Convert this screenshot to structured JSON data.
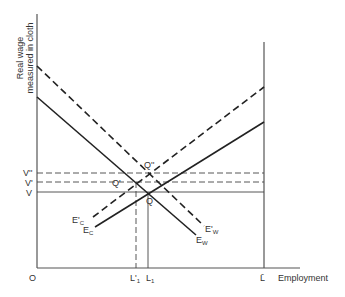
{
  "diagram": {
    "y_axis_label_line1": "Real wage",
    "y_axis_label_line2": "measured in cloth",
    "x_axis_label": "Employment",
    "origin_label": "O",
    "y_ticks": [
      {
        "label": "V''",
        "y": 173
      },
      {
        "label": "V'",
        "y": 182
      },
      {
        "label": "V",
        "y": 192
      }
    ],
    "x_ticks": [
      {
        "label": "L'",
        "sub": "1",
        "x": 136
      },
      {
        "label": "L",
        "sub": "1",
        "x": 148
      },
      {
        "label": "L̄",
        "sub": "",
        "x": 264
      }
    ],
    "points": [
      {
        "label": "Q''",
        "x": 146,
        "y": 172
      },
      {
        "label": "Q'",
        "x": 135,
        "y": 182
      },
      {
        "label": "Q",
        "x": 148,
        "y": 192
      }
    ],
    "curves": [
      {
        "name": "E_W",
        "label": "E",
        "sub": "W",
        "style": "solid",
        "x1": 37,
        "y1": 97,
        "x2": 196,
        "y2": 235
      },
      {
        "name": "E'_W",
        "label": "E'",
        "sub": "W",
        "style": "dashed",
        "x1": 37,
        "y1": 66,
        "x2": 204,
        "y2": 226
      },
      {
        "name": "E_C",
        "label": "E",
        "sub": "C",
        "style": "solid",
        "x1": 95,
        "y1": 227,
        "x2": 264,
        "y2": 122
      },
      {
        "name": "E'_C",
        "label": "E'",
        "sub": "C",
        "style": "dashed",
        "x1": 93,
        "y1": 217,
        "x2": 264,
        "y2": 87
      }
    ]
  }
}
